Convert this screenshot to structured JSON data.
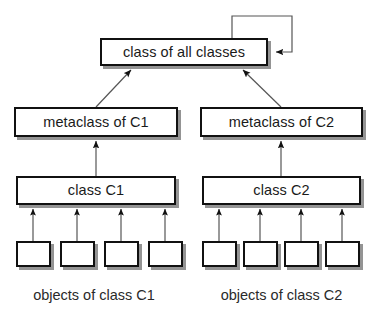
{
  "diagram": {
    "title": "class of all classes",
    "nodes": {
      "root": {
        "label": "class of all classes"
      },
      "metaclass_c1": {
        "label": "metaclass of C1"
      },
      "metaclass_c2": {
        "label": "metaclass of C2"
      },
      "class_c1": {
        "label": "class C1"
      },
      "class_c2": {
        "label": "class C2"
      }
    },
    "objects": {
      "c1": [
        {
          "label": ""
        },
        {
          "label": ""
        },
        {
          "label": ""
        },
        {
          "label": ""
        }
      ],
      "c2": [
        {
          "label": ""
        },
        {
          "label": ""
        },
        {
          "label": ""
        },
        {
          "label": ""
        }
      ]
    },
    "captions": {
      "objects_c1": "objects of class C1",
      "objects_c2": "objects of class C2"
    },
    "edges": [
      {
        "from": "metaclass_c1",
        "to": "root",
        "style": "diagonal-arrow"
      },
      {
        "from": "metaclass_c2",
        "to": "root",
        "style": "diagonal-arrow"
      },
      {
        "from": "class_c1",
        "to": "metaclass_c1",
        "style": "vertical-arrow"
      },
      {
        "from": "class_c2",
        "to": "metaclass_c2",
        "style": "vertical-arrow"
      },
      {
        "from": "objects_c1",
        "to": "class_c1",
        "style": "vertical-arrow",
        "count": 4
      },
      {
        "from": "objects_c2",
        "to": "class_c2",
        "style": "vertical-arrow",
        "count": 4
      },
      {
        "from": "root",
        "to": "root",
        "style": "self-loop"
      }
    ],
    "colors": {
      "background": "#ffffff",
      "stroke": "#111111",
      "node_fill": "#ffffff",
      "shadow": "#3c3c3c",
      "text": "#1a1a1a",
      "thin_line": "#555555"
    }
  }
}
